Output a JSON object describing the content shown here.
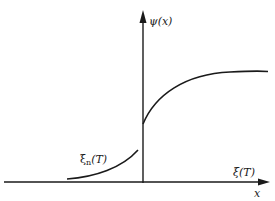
{
  "diagram": {
    "colors": {
      "ink": "#1a1a1a",
      "background": "#ffffff"
    },
    "labels": {
      "y_axis": "ψ(x)",
      "x_axis_upper": "ξ(T)",
      "x_axis_lower": "x",
      "left_curve_main": "ξ",
      "left_curve_sub": "n",
      "left_curve_arg": "(T)"
    },
    "axes": {
      "origin_px": [
        143,
        182
      ],
      "x_axis_end_px": [
        270,
        182
      ],
      "y_axis_end_px": [
        143,
        10
      ]
    },
    "curves": [
      {
        "name": "left-curve",
        "description": "ξ_n(T) rising toward the axis below the discontinuity"
      },
      {
        "name": "right-curve",
        "description": "ψ(x) jumps at x=0 then rises and saturates"
      }
    ]
  }
}
